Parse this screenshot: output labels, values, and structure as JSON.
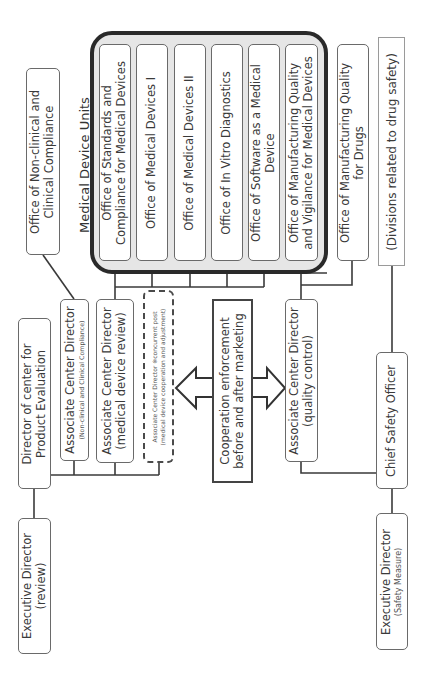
{
  "diagram": {
    "orientation": "rotated 90 degrees counter-clockwise",
    "group_title": "Medical Device Units",
    "left_column": {
      "executive_director_review": {
        "line1": "Executive Director",
        "line2": "(review)"
      },
      "director_center": {
        "line1": "Director of center for",
        "line2": "Product Evaluation"
      }
    },
    "associates": [
      {
        "id": "nonclinical",
        "line1": "Associate Center Director",
        "line2": "(Non-clinical and Clinical Compliance)"
      },
      {
        "id": "device_review",
        "line1": "Associate Center Director",
        "line2": "(medical device review)"
      },
      {
        "id": "concurrent",
        "line1": "Associate Center Director ※concurrent post",
        "line2": "(medical device cooperation and adjustment)"
      },
      {
        "id": "quality_control",
        "line1": "Associate Center Director",
        "line2": "(quality control)"
      }
    ],
    "cooperation": {
      "line1": "Cooperation enforcement",
      "line2": "before and after marketing"
    },
    "offices": {
      "nonclinical": {
        "line1": "Office of Non-clinical and",
        "line2": "Clinical Compliance"
      },
      "units": [
        {
          "line1": "Office of Standards and",
          "line2": "Compliance for Medical Devices"
        },
        {
          "line1": "Office of Medical Devices I",
          "line2": ""
        },
        {
          "line1": "Office of Medical Devices II",
          "line2": ""
        },
        {
          "line1": "Office of In Vitro Diagnostics",
          "line2": ""
        },
        {
          "line1": "Office of Software as a Medical",
          "line2": "Device"
        },
        {
          "line1": "Office of Manufacturing  Quality",
          "line2": "and Vigilance for Medical Devices"
        }
      ],
      "drugs_quality": {
        "line1": "Office of Manufacturing Quality",
        "line2": "for Drugs"
      }
    },
    "drug_safety": {
      "label": "(Divisions related to drug safety)"
    },
    "safety": {
      "chief": {
        "line1": "Chief Safety Officer"
      },
      "executive_director_safety": {
        "line1": "Executive Director",
        "line2": "(Safety Measure)"
      }
    },
    "colors": {
      "frame": "#2a2a2a",
      "frame_fill": "#e6e6e6",
      "box_border": "#6a6a6a",
      "text": "#3a3a3a",
      "line": "#333333"
    }
  }
}
